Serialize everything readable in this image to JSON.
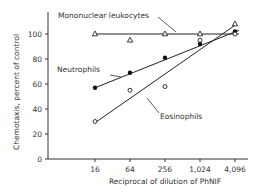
{
  "chart_data": {
    "type": "line",
    "title": "",
    "xlabel": "Reciprocal of dilution of PhNIF",
    "ylabel": "Chemotaxis, percent of control",
    "categories": [
      "16",
      "64",
      "256",
      "1,024",
      "4,096"
    ],
    "x": [
      16,
      64,
      256,
      1024,
      4096
    ],
    "xscale": "log",
    "ylim": [
      0,
      110
    ],
    "yticks": [
      0,
      20,
      40,
      60,
      80,
      100
    ],
    "grid": false,
    "legend_position": "inline annotations",
    "series": [
      {
        "name": "Mononuclear leukocytes",
        "marker": "open-triangle",
        "values": [
          100,
          95,
          100,
          100,
          108
        ],
        "fit_line": {
          "from": [
            16,
            100
          ],
          "to": [
            4096,
            100
          ]
        }
      },
      {
        "name": "Neutrophils",
        "marker": "filled-circle",
        "values": [
          57,
          69,
          81,
          92,
          102
        ],
        "fit_line": {
          "from": [
            16,
            57
          ],
          "to": [
            4096,
            103
          ]
        }
      },
      {
        "name": "Eosinophils",
        "marker": "open-circle",
        "values": [
          30,
          55,
          58,
          95,
          100
        ],
        "fit_line": {
          "from": [
            16,
            29
          ],
          "to": [
            4096,
            107
          ]
        }
      }
    ],
    "annotations": [
      {
        "text": "Mononuclear leukocytes",
        "series": "Mononuclear leukocytes"
      },
      {
        "text": "Neutrophils",
        "series": "Neutrophils"
      },
      {
        "text": "Eosinophils",
        "series": "Eosinophils"
      }
    ]
  },
  "labels": {
    "ylabel": "Chemotaxis, percent of control",
    "xlabel": "Reciprocal of dilution of PhNIF",
    "mono": "Mononuclear leukocytes",
    "neut": "Neutrophils",
    "eos": "Eosinophils",
    "yticks": [
      "0",
      "20",
      "40",
      "60",
      "80",
      "100"
    ],
    "xticks": [
      "16",
      "64",
      "256",
      "1,024",
      "4,096"
    ]
  }
}
